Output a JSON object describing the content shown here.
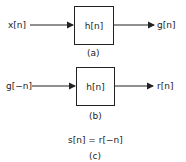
{
  "diagram": {
    "a": {
      "input": "x[n]",
      "system": "h[n]",
      "output": "g[n]",
      "caption": "(a)"
    },
    "b": {
      "input": "g[−n]",
      "system": "h[n]",
      "output": "r[n]",
      "caption": "(b)"
    },
    "c": {
      "equation": "s[n] = r[−n]",
      "caption": "(c)"
    }
  }
}
